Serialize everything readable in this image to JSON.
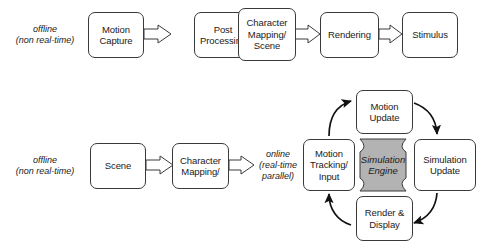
{
  "diagram": {
    "colors": {
      "stroke": "#3a3a3a",
      "engine_fill": "#b3b3b3",
      "background": "#ffffff",
      "text": "#1a1a1a"
    },
    "pipelines": [
      {
        "name": "offline-pipeline",
        "label": {
          "line1": "offline",
          "line2": "(non real-time)",
          "text": "offline\n(non real-time)"
        },
        "nodes": [
          {
            "id": "motion-capture",
            "text": "Motion\nCapture"
          },
          {
            "id": "post-processing",
            "text": "Post\nProcessing"
          },
          {
            "id": "character-mapping-scene",
            "text": "Character\nMapping/\nScene"
          },
          {
            "id": "rendering",
            "text": "Rendering"
          },
          {
            "id": "stimulus",
            "text": "Stimulus"
          }
        ],
        "arrows": [
          "block-arrow-right",
          "block-arrow-right",
          "block-arrow-right",
          "block-arrow-right"
        ]
      },
      {
        "name": "online-pipeline",
        "label": {
          "line1": "offline",
          "line2": "(non real-time)",
          "text": "offline\n(non real-time)"
        },
        "nodes": [
          {
            "id": "scene",
            "text": "Scene"
          },
          {
            "id": "character-mapping",
            "text": "Character\nMapping/"
          }
        ],
        "arrows": [
          "block-arrow-right",
          "block-arrow-right"
        ],
        "online_label": {
          "line1": "online",
          "line2": "(real-time",
          "line3": "parallel)",
          "text": "online\n(real-time\nparallel)"
        },
        "cycle": {
          "name": "simulation-loop",
          "center": {
            "id": "simulation-engine",
            "text": "Simulation\nEngine",
            "fill": "#b3b3b3",
            "italic": true
          },
          "nodes": [
            {
              "id": "motion-update",
              "text": "Motion\nUpdate",
              "position": "top"
            },
            {
              "id": "simulation-update",
              "text": "Simulation\nUpdate",
              "position": "right"
            },
            {
              "id": "render-display",
              "text": "Render &\nDisplay",
              "position": "bottom"
            },
            {
              "id": "motion-tracking-input",
              "text": "Motion\nTracking/\nInput",
              "position": "left"
            }
          ],
          "arrows": [
            {
              "from": "motion-tracking-input",
              "to": "motion-update",
              "style": "curved-solid"
            },
            {
              "from": "motion-update",
              "to": "simulation-update",
              "style": "curved-solid"
            },
            {
              "from": "simulation-update",
              "to": "render-display",
              "style": "curved-solid"
            },
            {
              "from": "render-display",
              "to": "motion-tracking-input",
              "style": "curved-solid"
            }
          ]
        }
      }
    ]
  }
}
